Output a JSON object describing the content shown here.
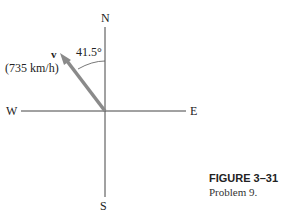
{
  "figure": {
    "compass": {
      "north": "N",
      "south": "S",
      "east": "E",
      "west": "W"
    },
    "vector": {
      "symbol": "v⃗",
      "label": "v",
      "magnitude": "(735 km/h)",
      "angle": "41.5°"
    },
    "caption": {
      "title": "FIGURE 3–31",
      "text": "Problem 9."
    },
    "colors": {
      "vector": "#8a8a8a",
      "axes": "#333333"
    }
  }
}
